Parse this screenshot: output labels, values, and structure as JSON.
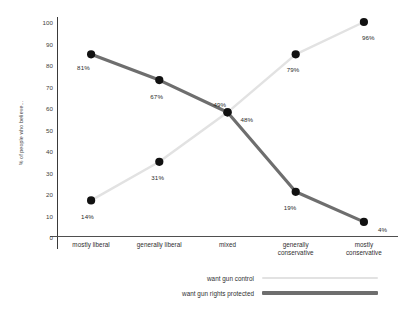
{
  "chart_data": {
    "type": "line",
    "title": "",
    "xlabel": "",
    "ylabel": "% of people who believe...",
    "categories": [
      "mostly liberal",
      "generally liberal",
      "mixed",
      "generally conservative",
      "mostly conservative"
    ],
    "ylim": [
      0,
      100
    ],
    "yticks": [
      "0",
      "10",
      "20",
      "30",
      "40",
      "50",
      "60",
      "70",
      "80",
      "90",
      "100"
    ],
    "grid": false,
    "legend_position": "bottom",
    "series": [
      {
        "name": "want gun control",
        "color": "#e2e2e2",
        "values": [
          14,
          31,
          49,
          79,
          96
        ],
        "labels": [
          "14%",
          "31%",
          "49%",
          "79%",
          "96%"
        ]
      },
      {
        "name": "want gun rights protected",
        "color": "#6e6e6e",
        "values": [
          81,
          67,
          48,
          19,
          4
        ],
        "labels": [
          "81%",
          "67%",
          "48%",
          "19%",
          "4%"
        ]
      }
    ]
  },
  "legend": {
    "items": [
      {
        "label": "want gun control",
        "color": "#e2e2e2"
      },
      {
        "label": "want gun rights protected",
        "color": "#6e6e6e"
      }
    ]
  },
  "axis": {
    "y_title": "% of people who believe...",
    "y_ticks": [
      "100",
      "90",
      "80",
      "70",
      "60",
      "50",
      "40",
      "30",
      "20",
      "10",
      "0"
    ],
    "x_categories": [
      "mostly liberal",
      "generally liberal",
      "mixed",
      "generally conservative",
      "mostly conservative"
    ]
  },
  "colors": {
    "gun_control_line": "#e2e2e2",
    "gun_rights_line": "#6e6e6e",
    "marker": "#111111",
    "axis": "#3a3a3a",
    "text": "#2e2e2e"
  }
}
